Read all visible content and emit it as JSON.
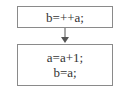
{
  "flowchart": {
    "nodes": [
      {
        "id": "step1",
        "lines": [
          "b=++a;"
        ]
      },
      {
        "id": "step2",
        "lines": [
          "a=a+1;",
          "b=a;"
        ]
      }
    ],
    "edges": [
      {
        "from": "step1",
        "to": "step2"
      }
    ]
  },
  "colors": {
    "border": "#8a8a8a",
    "text": "#333333",
    "arrow": "#555555"
  }
}
